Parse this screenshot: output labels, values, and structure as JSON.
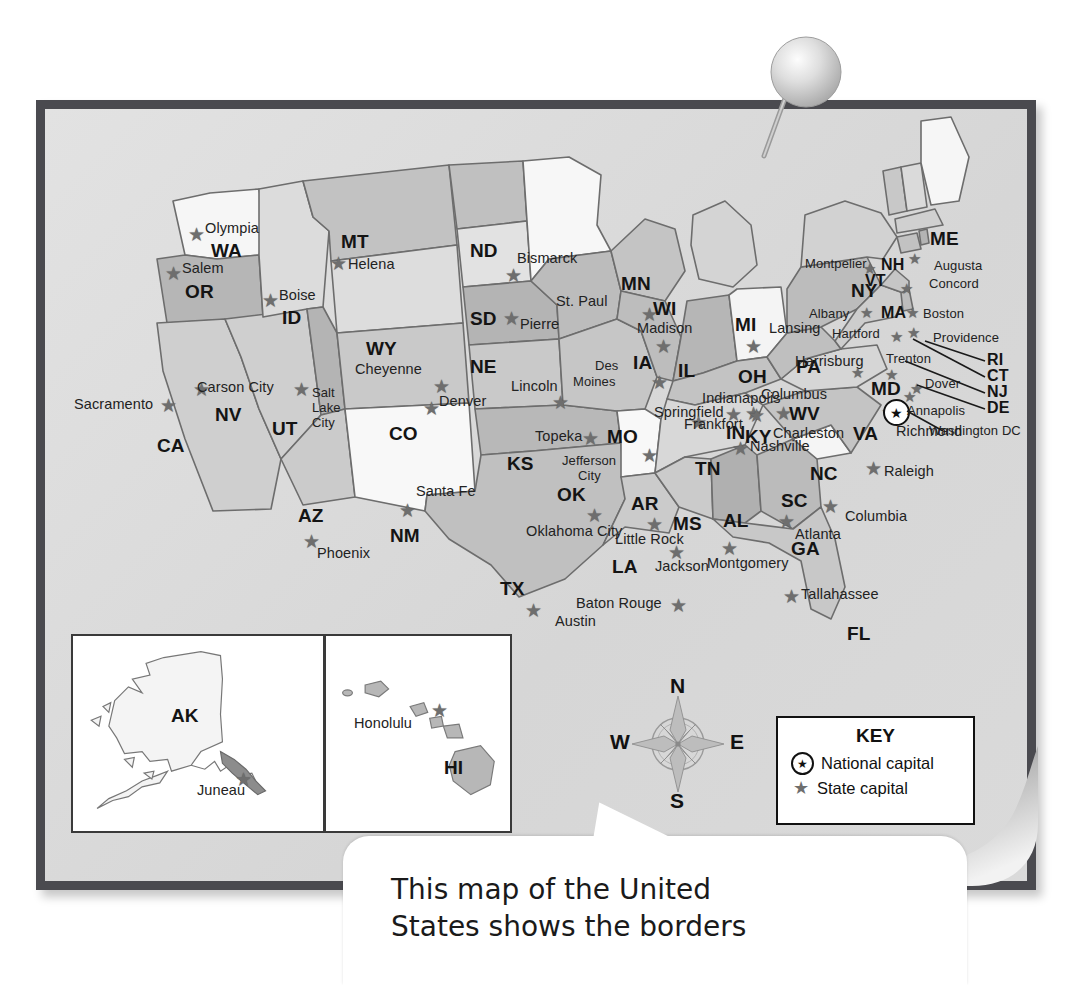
{
  "document": {
    "type": "printed-map-photo",
    "title": "Map of the United States",
    "pin_icon": "pushpin-icon"
  },
  "key": {
    "title": "KEY",
    "entries": [
      {
        "icon": "national-capital-star-icon",
        "label": "National capital"
      },
      {
        "icon": "state-capital-star-icon",
        "label": "State capital"
      }
    ]
  },
  "compass": {
    "north": "N",
    "south": "S",
    "east": "E",
    "west": "W",
    "icon": "compass-rose-icon"
  },
  "callout": {
    "text": "This map of the United\nStates shows the borders",
    "line1": "This map of the United",
    "line2": "States shows the borders"
  },
  "insets": [
    {
      "abbr": "AK",
      "capital": "Juneau"
    },
    {
      "abbr": "HI",
      "capital": "Honolulu"
    }
  ],
  "national_capital": {
    "name": "Washington DC",
    "state_abbr": "MD"
  },
  "states": [
    {
      "abbr": "WA",
      "capital": "Olympia"
    },
    {
      "abbr": "OR",
      "capital": "Salem"
    },
    {
      "abbr": "ID",
      "capital": "Boise"
    },
    {
      "abbr": "MT",
      "capital": "Helena"
    },
    {
      "abbr": "ND",
      "capital": "Bismarck"
    },
    {
      "abbr": "MN",
      "capital": "St. Paul"
    },
    {
      "abbr": "WI",
      "capital": "Madison"
    },
    {
      "abbr": "MI",
      "capital": "Lansing"
    },
    {
      "abbr": "SD",
      "capital": "Pierre"
    },
    {
      "abbr": "WY",
      "capital": "Cheyenne"
    },
    {
      "abbr": "NE",
      "capital": "Lincoln"
    },
    {
      "abbr": "IA",
      "capital": "Des Moines"
    },
    {
      "abbr": "IL",
      "capital": "Springfield"
    },
    {
      "abbr": "IN",
      "capital": "Indianapolis"
    },
    {
      "abbr": "OH",
      "capital": "Columbus"
    },
    {
      "abbr": "CA",
      "capital": "Sacramento"
    },
    {
      "abbr": "NV",
      "capital": "Carson City"
    },
    {
      "abbr": "UT",
      "capital": "Salt Lake City"
    },
    {
      "abbr": "CO",
      "capital": "Denver"
    },
    {
      "abbr": "KS",
      "capital": "Topeka"
    },
    {
      "abbr": "MO",
      "capital": "Jefferson City"
    },
    {
      "abbr": "KY",
      "capital": "Frankfort"
    },
    {
      "abbr": "WV",
      "capital": "Charleston"
    },
    {
      "abbr": "VA",
      "capital": "Richmond"
    },
    {
      "abbr": "PA",
      "capital": "Harrisburg"
    },
    {
      "abbr": "MD",
      "capital": "Annapolis"
    },
    {
      "abbr": "DE",
      "capital": "Dover"
    },
    {
      "abbr": "NJ",
      "capital": "Trenton"
    },
    {
      "abbr": "NY",
      "capital": "Albany"
    },
    {
      "abbr": "CT",
      "capital": "Hartford"
    },
    {
      "abbr": "RI",
      "capital": "Providence"
    },
    {
      "abbr": "MA",
      "capital": "Boston"
    },
    {
      "abbr": "VT",
      "capital": "Montpelier"
    },
    {
      "abbr": "NH",
      "capital": "Concord"
    },
    {
      "abbr": "ME",
      "capital": "Augusta"
    },
    {
      "abbr": "AZ",
      "capital": "Phoenix"
    },
    {
      "abbr": "NM",
      "capital": "Santa Fe"
    },
    {
      "abbr": "OK",
      "capital": "Oklahoma City"
    },
    {
      "abbr": "TX",
      "capital": "Austin"
    },
    {
      "abbr": "AR",
      "capital": "Little Rock"
    },
    {
      "abbr": "LA",
      "capital": "Baton Rouge"
    },
    {
      "abbr": "MS",
      "capital": "Jackson"
    },
    {
      "abbr": "AL",
      "capital": "Montgomery"
    },
    {
      "abbr": "TN",
      "capital": "Nashville"
    },
    {
      "abbr": "GA",
      "capital": "Atlanta"
    },
    {
      "abbr": "FL",
      "capital": "Tallahassee"
    },
    {
      "abbr": "SC",
      "capital": "Columbia"
    },
    {
      "abbr": "NC",
      "capital": "Raleigh"
    }
  ],
  "labels": {
    "Olympia": "Olympia",
    "WA": "WA",
    "Salem": "Salem",
    "OR": "OR",
    "Boise": "Boise",
    "ID": "ID",
    "MT": "MT",
    "Helena": "Helena",
    "ND": "ND",
    "Bismarck": "Bismarck",
    "MN": "MN",
    "StPaul": "St. Paul",
    "WI": "WI",
    "Madison": "Madison",
    "MI": "MI",
    "Lansing": "Lansing",
    "SD": "SD",
    "Pierre": "Pierre",
    "WY": "WY",
    "Cheyenne": "Cheyenne",
    "NE": "NE",
    "Lincoln": "Lincoln",
    "IA": "IA",
    "Des": "Des",
    "Moines": "Moines",
    "IL": "IL",
    "Springfield": "Springfield",
    "IN": "IN",
    "Indianapolis": "Indianapolis",
    "OH": "OH",
    "Columbus": "Columbus",
    "CA": "CA",
    "Sacramento": "Sacramento",
    "NV": "NV",
    "CarsonCity": "Carson City",
    "UT": "UT",
    "Salt": "Salt",
    "Lake": "Lake",
    "City": "City",
    "CO": "CO",
    "Denver": "Denver",
    "KS": "KS",
    "Topeka": "Topeka",
    "MO": "MO",
    "Jefferson": "Jefferson",
    "City2": "City",
    "KY": "KY",
    "Frankfort": "Frankfort",
    "WV": "WV",
    "Charleston": "Charleston",
    "VA": "VA",
    "Richmond": "Richmond",
    "PA": "PA",
    "Harrisburg": "Harrisburg",
    "MD": "MD",
    "Annapolis": "Annapolis",
    "WashingtonDC": "Washington DC",
    "Dover": "Dover",
    "Trenton": "Trenton",
    "NY": "NY",
    "Albany": "Albany",
    "Hartford": "Hartford",
    "Providence": "Providence",
    "MA": "MA",
    "Boston": "Boston",
    "VT": "VT",
    "Montpelier": "Montpelier",
    "NH": "NH",
    "Concord": "Concord",
    "ME": "ME",
    "Augusta": "Augusta",
    "RI": "RI",
    "CT": "CT",
    "NJ": "NJ",
    "DE": "DE",
    "AZ": "AZ",
    "Phoenix": "Phoenix",
    "NM": "NM",
    "SantaFe": "Santa Fe",
    "OK": "OK",
    "OklahomaCity": "Oklahoma City",
    "TX": "TX",
    "Austin": "Austin",
    "AR": "AR",
    "LittleRock": "Little Rock",
    "LA": "LA",
    "BatonRouge": "Baton Rouge",
    "MS": "MS",
    "Jackson": "Jackson",
    "AL": "AL",
    "Montgomery": "Montgomery",
    "TN": "TN",
    "Nashville": "Nashville",
    "GA": "GA",
    "Atlanta": "Atlanta",
    "FL": "FL",
    "Tallahassee": "Tallahassee",
    "SC": "SC",
    "Columbia": "Columbia",
    "NC": "NC",
    "Raleigh": "Raleigh",
    "AK": "AK",
    "Juneau": "Juneau",
    "HI": "HI",
    "Honolulu": "Honolulu"
  },
  "colors": {
    "board_frame": "#4a4a4f",
    "board_face": "#dcdcdc",
    "state_light": "#f4f4f4",
    "state_mid": "#d2d2d2",
    "state_dark": "#b0b0b0",
    "star": "#6e6e6e",
    "text": "#1f1f1f"
  }
}
